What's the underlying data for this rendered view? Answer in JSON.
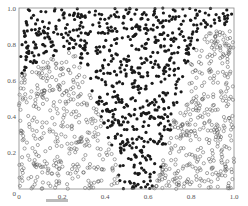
{
  "chart_data": {
    "type": "scatter",
    "title": "",
    "xlabel": "",
    "ylabel": "",
    "xlim": [
      0,
      1.0
    ],
    "ylim": [
      0,
      1.0
    ],
    "grid": false,
    "legend": null,
    "x_ticks": [
      "0",
      "0.2",
      "0.4",
      "0.6",
      "0.8",
      "1.0"
    ],
    "y_ticks": [
      "0",
      "0.2",
      "0.4",
      "0.6",
      "0.8",
      "1.0"
    ],
    "series": [
      {
        "name": "class-filled",
        "marker": "filled-circle",
        "color": "#1a1a1a",
        "region_description": "Occupies upper band (y > ~0.6 for x < 0.35, y > ~0.85 for x > 0.85) and a downward wedge centred near x≈0.55 reaching y≈0 between x≈0.45 and x≈0.7",
        "approx_count": 650
      },
      {
        "name": "class-hollow",
        "marker": "open-circle",
        "color": "#555555",
        "region_description": "Fills lower-left region (x < ~0.45, y < ~0.6) and lower-right region (x > ~0.7, y < ~0.85), bounded by the filled wedge",
        "approx_count": 750
      }
    ],
    "boundary": {
      "left_edge_of_wedge": [
        [
          0.0,
          0.62
        ],
        [
          0.1,
          0.7
        ],
        [
          0.2,
          0.75
        ],
        [
          0.25,
          0.78
        ],
        [
          0.3,
          0.65
        ],
        [
          0.38,
          0.4
        ],
        [
          0.45,
          0.15
        ],
        [
          0.47,
          0.0
        ]
      ],
      "right_edge_of_wedge": [
        [
          1.0,
          0.87
        ],
        [
          0.9,
          0.88
        ],
        [
          0.85,
          0.87
        ],
        [
          0.8,
          0.7
        ],
        [
          0.75,
          0.5
        ],
        [
          0.7,
          0.3
        ],
        [
          0.66,
          0.12
        ],
        [
          0.62,
          0.0
        ]
      ]
    }
  },
  "caption": {
    "text_visible": false
  }
}
